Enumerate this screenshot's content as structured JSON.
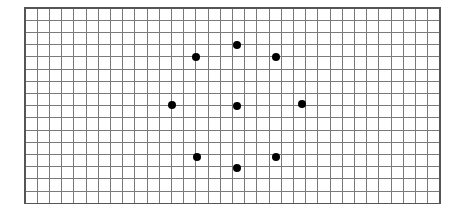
{
  "figure": {
    "title": "",
    "caption": "",
    "background_color": "#ffffff"
  },
  "chart_data": {
    "type": "scatter",
    "title": "",
    "subtitle": "",
    "xlabel": "",
    "ylabel": "",
    "grid": {
      "visible": true,
      "columns": 34,
      "rows": 16,
      "cell_size_px": 12.2,
      "origin_px": {
        "x": 25,
        "y": 8
      },
      "line_color": "#7a7a7a",
      "line_width_px": 1,
      "border_color": "#555555",
      "fill_color": "#ffffff"
    },
    "xlim": [
      0,
      34
    ],
    "ylim": [
      0,
      16
    ],
    "legend": {
      "visible": false,
      "position": "none"
    },
    "marker": {
      "shape": "circle",
      "color": "#000000",
      "diameter_px": 8
    },
    "points": [
      {
        "label": "top-center",
        "grid_x": 17.4,
        "grid_y": 3.0,
        "px_x": 237,
        "px_y": 45
      },
      {
        "label": "upper-left",
        "grid_x": 14.0,
        "grid_y": 4.0,
        "px_x": 196,
        "px_y": 57
      },
      {
        "label": "upper-right",
        "grid_x": 20.6,
        "grid_y": 4.0,
        "px_x": 276,
        "px_y": 57
      },
      {
        "label": "middle-left",
        "grid_x": 12.0,
        "grid_y": 8.0,
        "px_x": 172,
        "px_y": 105
      },
      {
        "label": "center",
        "grid_x": 17.4,
        "grid_y": 8.0,
        "px_x": 237,
        "px_y": 106
      },
      {
        "label": "middle-right",
        "grid_x": 22.7,
        "grid_y": 7.9,
        "px_x": 302,
        "px_y": 104
      },
      {
        "label": "lower-left",
        "grid_x": 14.1,
        "grid_y": 12.2,
        "px_x": 197,
        "px_y": 157
      },
      {
        "label": "bottom-center",
        "grid_x": 17.4,
        "grid_y": 13.1,
        "px_x": 237,
        "px_y": 168
      },
      {
        "label": "lower-right",
        "grid_x": 20.6,
        "grid_y": 12.2,
        "px_x": 276,
        "px_y": 157
      }
    ],
    "point_count": 9
  }
}
